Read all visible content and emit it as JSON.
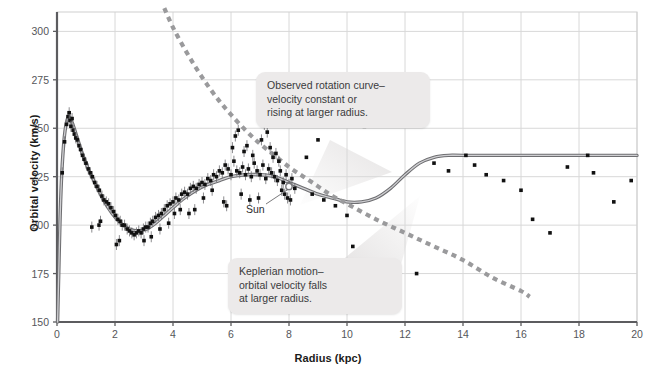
{
  "chart_data": {
    "type": "scatter",
    "title": "",
    "xlabel": "Radius (kpc)",
    "ylabel": "Orbital velocity (km/s)",
    "xlim": [
      0,
      20
    ],
    "ylim": [
      150,
      310
    ],
    "xticks": [
      0,
      2,
      4,
      6,
      8,
      10,
      12,
      14,
      16,
      18,
      20
    ],
    "yticks": [
      150,
      175,
      200,
      225,
      250,
      275,
      300
    ],
    "grid": true,
    "legend": "none",
    "annotations": [
      {
        "name": "observed-rotation-curve",
        "text": "Observed rotation curve–\nvelocity constant or\nrising at larger radius."
      },
      {
        "name": "keplerian-motion",
        "text": "Keplerian motion–\norbital velocity falls\nat larger radius."
      },
      {
        "name": "sun-marker",
        "text": "Sun",
        "x": 8.0,
        "y": 220
      }
    ],
    "series": [
      {
        "name": "Observed rotation curve (model fit)",
        "type": "line",
        "style": "solid",
        "color": "#8a8a8c",
        "points": [
          [
            0.02,
            150
          ],
          [
            0.06,
            175
          ],
          [
            0.1,
            200
          ],
          [
            0.15,
            222
          ],
          [
            0.22,
            240
          ],
          [
            0.3,
            251
          ],
          [
            0.4,
            256
          ],
          [
            0.52,
            253
          ],
          [
            0.68,
            246
          ],
          [
            0.85,
            238
          ],
          [
            1.05,
            230
          ],
          [
            1.3,
            222
          ],
          [
            1.6,
            213
          ],
          [
            1.9,
            206
          ],
          [
            2.2,
            201
          ],
          [
            2.5,
            198
          ],
          [
            2.8,
            197
          ],
          [
            3.1,
            198
          ],
          [
            3.4,
            201
          ],
          [
            3.7,
            205
          ],
          [
            4.0,
            209
          ],
          [
            4.4,
            214
          ],
          [
            4.8,
            218
          ],
          [
            5.2,
            221
          ],
          [
            5.6,
            223
          ],
          [
            6.0,
            225
          ],
          [
            6.5,
            226
          ],
          [
            7.0,
            226
          ],
          [
            7.5,
            225
          ],
          [
            8.0,
            222
          ],
          [
            8.5,
            219
          ],
          [
            9.0,
            216
          ],
          [
            9.5,
            214
          ],
          [
            10.0,
            212
          ],
          [
            10.5,
            212
          ],
          [
            11.0,
            214
          ],
          [
            11.5,
            219
          ],
          [
            12.0,
            226
          ],
          [
            12.5,
            232
          ],
          [
            13.0,
            235
          ],
          [
            13.5,
            236
          ],
          [
            14.0,
            236
          ],
          [
            16.0,
            236
          ],
          [
            18.0,
            236
          ],
          [
            20.0,
            236
          ]
        ]
      },
      {
        "name": "Keplerian motion",
        "type": "line",
        "style": "dashed",
        "color": "#9a9a9c",
        "points": [
          [
            3.7,
            312
          ],
          [
            4.0,
            302
          ],
          [
            4.4,
            291
          ],
          [
            4.8,
            281
          ],
          [
            5.2,
            272
          ],
          [
            5.6,
            264
          ],
          [
            6.0,
            257
          ],
          [
            6.5,
            249
          ],
          [
            7.0,
            242
          ],
          [
            7.5,
            236
          ],
          [
            8.0,
            230
          ],
          [
            8.5,
            225
          ],
          [
            9.0,
            220
          ],
          [
            9.5,
            215
          ],
          [
            10.0,
            211
          ],
          [
            11.0,
            203
          ],
          [
            12.0,
            196
          ],
          [
            13.0,
            189
          ],
          [
            14.0,
            182
          ],
          [
            15.0,
            173
          ],
          [
            16.0,
            166
          ],
          [
            16.3,
            163
          ]
        ]
      },
      {
        "name": "Inner disk measurements",
        "type": "scatter",
        "color": "#111111",
        "points": [
          [
            0.18,
            227
          ],
          [
            0.26,
            243
          ],
          [
            0.33,
            252
          ],
          [
            0.38,
            256
          ],
          [
            0.42,
            258
          ],
          [
            0.45,
            254
          ],
          [
            0.48,
            251
          ],
          [
            0.52,
            255
          ],
          [
            0.56,
            249
          ],
          [
            0.6,
            247
          ],
          [
            0.65,
            245
          ],
          [
            0.7,
            244
          ],
          [
            0.76,
            241
          ],
          [
            0.82,
            239
          ],
          [
            0.88,
            236
          ],
          [
            0.94,
            234
          ],
          [
            1.0,
            232
          ],
          [
            1.08,
            229
          ],
          [
            1.15,
            227
          ],
          [
            1.22,
            225
          ],
          [
            1.3,
            222
          ],
          [
            1.38,
            220
          ],
          [
            1.46,
            218
          ],
          [
            1.55,
            215
          ],
          [
            1.62,
            213
          ],
          [
            1.7,
            212
          ],
          [
            1.78,
            211
          ],
          [
            1.86,
            209
          ],
          [
            1.95,
            207
          ],
          [
            2.02,
            205
          ],
          [
            2.1,
            203
          ],
          [
            2.18,
            202
          ],
          [
            2.25,
            200
          ],
          [
            2.33,
            200
          ],
          [
            2.42,
            198
          ],
          [
            2.5,
            197
          ],
          [
            2.58,
            196
          ],
          [
            2.66,
            195
          ],
          [
            2.74,
            196
          ],
          [
            2.82,
            197
          ],
          [
            2.9,
            196
          ],
          [
            2.98,
            198
          ],
          [
            3.06,
            199
          ],
          [
            3.14,
            199
          ],
          [
            3.22,
            201
          ],
          [
            3.3,
            202
          ],
          [
            3.4,
            204
          ],
          [
            3.5,
            205
          ],
          [
            3.6,
            206
          ],
          [
            3.7,
            208
          ],
          [
            3.8,
            210
          ],
          [
            3.9,
            211
          ],
          [
            4.0,
            212
          ],
          [
            4.1,
            214
          ],
          [
            4.2,
            213
          ],
          [
            4.3,
            216
          ],
          [
            4.4,
            217
          ],
          [
            4.5,
            216
          ],
          [
            4.6,
            219
          ],
          [
            4.7,
            220
          ],
          [
            4.8,
            219
          ],
          [
            4.9,
            221
          ],
          [
            5.0,
            222
          ],
          [
            5.1,
            221
          ],
          [
            5.2,
            224
          ],
          [
            5.3,
            223
          ],
          [
            5.4,
            226
          ],
          [
            5.5,
            225
          ],
          [
            5.6,
            228
          ],
          [
            5.7,
            227
          ],
          [
            5.8,
            231
          ],
          [
            5.9,
            229
          ],
          [
            6.0,
            226
          ],
          [
            6.1,
            233
          ],
          [
            6.2,
            228
          ],
          [
            6.3,
            227
          ],
          [
            6.4,
            230
          ],
          [
            6.5,
            226
          ],
          [
            6.6,
            229
          ],
          [
            6.7,
            225
          ],
          [
            6.8,
            232
          ],
          [
            6.9,
            228
          ],
          [
            7.0,
            226
          ],
          [
            7.1,
            231
          ],
          [
            7.2,
            224
          ],
          [
            7.3,
            229
          ],
          [
            7.4,
            227
          ],
          [
            7.5,
            225
          ],
          [
            7.6,
            223
          ],
          [
            7.7,
            228
          ],
          [
            7.8,
            222
          ],
          [
            7.9,
            226
          ],
          [
            8.0,
            221
          ],
          [
            8.1,
            224
          ],
          [
            8.2,
            219
          ],
          [
            1.2,
            199
          ],
          [
            1.45,
            200
          ],
          [
            1.5,
            202
          ],
          [
            2.05,
            190
          ],
          [
            2.15,
            192
          ],
          [
            3.0,
            192
          ],
          [
            3.25,
            194
          ],
          [
            4.05,
            206
          ],
          [
            4.25,
            208
          ],
          [
            5.05,
            214
          ],
          [
            5.35,
            218
          ],
          [
            6.05,
            240
          ],
          [
            6.15,
            246
          ],
          [
            6.25,
            249
          ],
          [
            6.45,
            238
          ],
          [
            6.55,
            241
          ],
          [
            6.75,
            236
          ],
          [
            7.05,
            244
          ],
          [
            7.15,
            252
          ],
          [
            7.25,
            248
          ],
          [
            7.35,
            240
          ],
          [
            7.45,
            235
          ],
          [
            7.55,
            237
          ],
          [
            7.65,
            233
          ],
          [
            7.75,
            218
          ],
          [
            7.85,
            216
          ],
          [
            7.95,
            214
          ],
          [
            8.05,
            213
          ],
          [
            5.75,
            212
          ],
          [
            5.85,
            210
          ],
          [
            6.35,
            216
          ],
          [
            6.65,
            213
          ],
          [
            6.95,
            214
          ],
          [
            4.55,
            206
          ],
          [
            4.75,
            208
          ],
          [
            3.55,
            198
          ],
          [
            3.85,
            201
          ]
        ]
      },
      {
        "name": "Outer disk measurements",
        "type": "scatter",
        "color": "#111111",
        "points": [
          [
            8.6,
            235
          ],
          [
            8.8,
            216
          ],
          [
            9.2,
            213
          ],
          [
            9.6,
            210
          ],
          [
            10.0,
            205
          ],
          [
            10.2,
            189
          ],
          [
            11.4,
            256
          ],
          [
            11.9,
            262
          ],
          [
            12.0,
            262
          ],
          [
            13.0,
            232
          ],
          [
            13.5,
            228
          ],
          [
            14.1,
            236
          ],
          [
            14.4,
            231
          ],
          [
            14.8,
            226
          ],
          [
            15.4,
            223
          ],
          [
            16.0,
            218
          ],
          [
            16.4,
            203
          ],
          [
            17.6,
            230
          ],
          [
            18.3,
            236
          ],
          [
            18.5,
            227
          ],
          [
            19.2,
            212
          ],
          [
            19.8,
            223
          ],
          [
            12.4,
            175
          ],
          [
            17.0,
            196
          ],
          [
            10.6,
            251
          ],
          [
            9.0,
            244
          ]
        ]
      }
    ]
  },
  "axes": {
    "xlabel": "Radius (kpc)",
    "ylabel": "Orbital velocity (km/s)",
    "xticks": [
      "0",
      "2",
      "4",
      "6",
      "8",
      "10",
      "12",
      "14",
      "16",
      "18",
      "20"
    ],
    "yticks": [
      "150",
      "175",
      "200",
      "225",
      "250",
      "275",
      "300"
    ]
  },
  "annotations": {
    "observed": "Observed rotation curve–\nvelocity constant or\nrising at larger radius.",
    "keplerian": "Keplerian motion–\norbital velocity falls\nat larger radius.",
    "sun": "Sun"
  },
  "colors": {
    "curve_solid": "#8a8a8c",
    "curve_dashed": "#9a9a9c",
    "points": "#111111",
    "grid": "#d8d8d8",
    "axis": "#6b6b6e",
    "callout_bg": "#eceaea",
    "text": "#3a3a3c"
  }
}
